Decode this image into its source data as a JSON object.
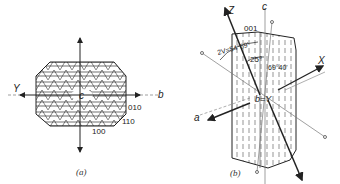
{
  "panel_a": {
    "caption": "(a)",
    "labels": {
      "y_axis": "Y",
      "b_axis": "b",
      "c_axis": "c"
    },
    "faces": [
      "010",
      "110",
      "100"
    ]
  },
  "panel_b": {
    "caption": "(b)",
    "labels": {
      "z_axis": "Z",
      "c_axis": "c",
      "x_axis": "X",
      "a_axis": "a",
      "b_eq_y": "b=Y",
      "face_001": "001"
    },
    "angles": {
      "two_v": "2V=54°69'",
      "angle_25": "25°",
      "angle_69": "69°40'"
    }
  },
  "colors": {
    "ink": "#222222",
    "light_line": "#777777",
    "background": "#ffffff"
  }
}
